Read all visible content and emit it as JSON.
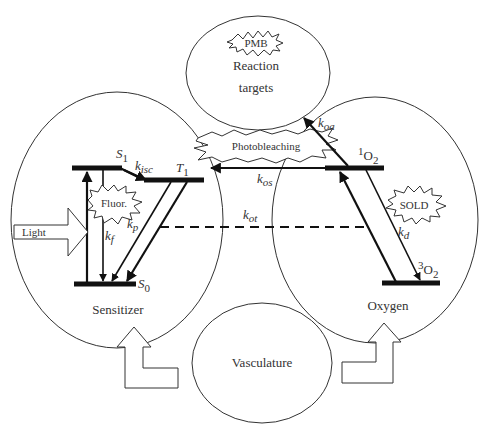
{
  "diagram": {
    "nodes": {
      "reaction_targets": {
        "label_line1": "Reaction",
        "label_line2": "targets",
        "burst": "PMB"
      },
      "sensitizer": {
        "label": "Sensitizer",
        "burst": "Fluor."
      },
      "oxygen": {
        "label": "Oxygen",
        "burst": "SOLD"
      },
      "vasculature": {
        "label": "Vasculature"
      }
    },
    "input": {
      "light": "Light"
    },
    "center_burst": "Photobleaching",
    "levels": {
      "s1": {
        "base": "S",
        "sub": "1"
      },
      "t1": {
        "base": "T",
        "sub": "1"
      },
      "s0": {
        "base": "S",
        "sub": "0"
      },
      "singlet_o2": {
        "sup": "1",
        "base": "O",
        "sub": "2"
      },
      "triplet_o2": {
        "sup": "3",
        "base": "O",
        "sub": "2"
      }
    },
    "rates": {
      "k_isc": {
        "base": "k",
        "sub": "isc"
      },
      "k_f": {
        "base": "k",
        "sub": "f"
      },
      "k_p": {
        "base": "k",
        "sub": "p"
      },
      "k_ot": {
        "base": "k",
        "sub": "ot"
      },
      "k_os": {
        "base": "k",
        "sub": "os"
      },
      "k_oa": {
        "base": "k",
        "sub": "oa"
      },
      "k_d": {
        "base": "k",
        "sub": "d"
      }
    }
  }
}
